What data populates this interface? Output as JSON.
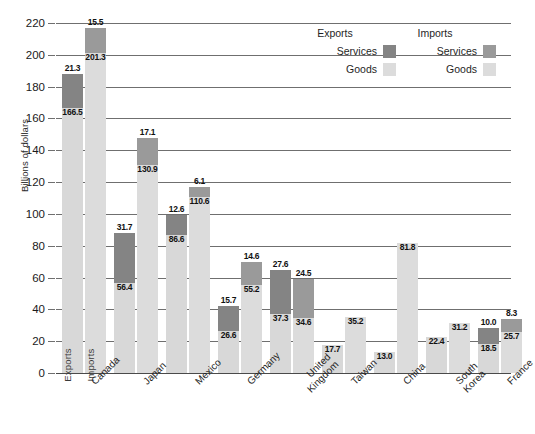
{
  "chart_data": {
    "type": "bar",
    "title": "",
    "subtitle": "",
    "xlabel": "",
    "ylabel": "Billions of dollars",
    "ylim": [
      0,
      220
    ],
    "ytick_step": 20,
    "yticks": [
      "220",
      "200",
      "180",
      "160",
      "140",
      "120",
      "100",
      "80",
      "60",
      "40",
      "20",
      "0"
    ],
    "grid": true,
    "legend_position": "top-right",
    "stacked": true,
    "categories": [
      "Canada",
      "Japan",
      "Mexico",
      "Germany",
      "United Kingdom",
      "Taiwan",
      "China",
      "South Korea",
      "France"
    ],
    "series": [
      {
        "name": "Exports Goods",
        "values": [
          166.5,
          56.4,
          86.6,
          26.6,
          37.3,
          17.7,
          13.0,
          22.4,
          18.5
        ]
      },
      {
        "name": "Exports Services",
        "values": [
          21.3,
          31.7,
          12.6,
          15.7,
          27.6,
          null,
          null,
          null,
          10.0
        ]
      },
      {
        "name": "Imports Goods",
        "values": [
          201.3,
          130.9,
          110.6,
          55.2,
          34.6,
          35.2,
          81.8,
          31.2,
          25.7
        ]
      },
      {
        "name": "Imports Services",
        "values": [
          15.5,
          17.1,
          6.1,
          14.6,
          24.5,
          null,
          null,
          null,
          8.3
        ]
      }
    ],
    "bar_inner_labels": [
      "Exports",
      "Imports"
    ],
    "colors": {
      "exports_services": "#848484",
      "imports_services": "#9a9a9a",
      "exports_goods": "#d8d8d8",
      "imports_goods": "#dcdcdc",
      "gridline": "#6f6f6f",
      "text": "#1a1a1a"
    }
  },
  "legend": {
    "exports_header": "Exports",
    "imports_header": "Imports",
    "exports_services_label": "Services",
    "imports_services_label": "Services",
    "exports_goods_label": "Goods",
    "imports_goods_label": "Goods"
  },
  "axis": {
    "y_title": "Billions of dollars"
  }
}
